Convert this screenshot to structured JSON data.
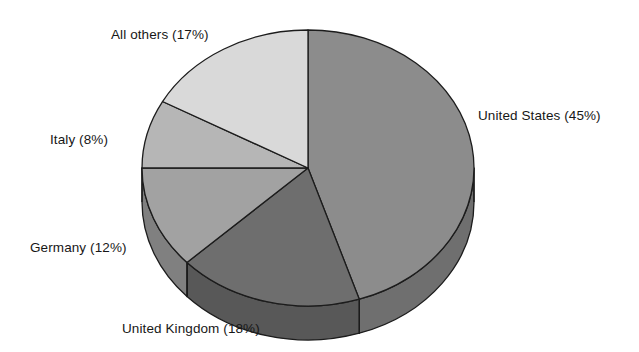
{
  "chart_data": {
    "type": "pie",
    "title": "",
    "subtitle": "",
    "xlabel": "",
    "ylabel": "",
    "legend_position": "none",
    "grid": false,
    "three_d": true,
    "units": "percent",
    "start_angle_deg": 0,
    "direction": "clockwise",
    "categories": [
      "United States",
      "United Kingdom",
      "Germany",
      "Italy",
      "All others"
    ],
    "values": [
      45,
      18,
      12,
      8,
      17
    ],
    "labels": [
      "United States (45%)",
      "United Kingdom (18%)",
      "Germany (12%)",
      "Italy (8%)",
      "All others (17%)"
    ],
    "slices": [
      {
        "name": "United States",
        "value": 45,
        "label": "United States (45%)",
        "color": "#8c8c8c",
        "side_color": "#6f6f6f"
      },
      {
        "name": "United Kingdom",
        "value": 18,
        "label": "United Kingdom (18%)",
        "color": "#6e6e6e",
        "side_color": "#585858"
      },
      {
        "name": "Germany",
        "value": 12,
        "label": "Germany (12%)",
        "color": "#a2a2a2",
        "side_color": "#808080"
      },
      {
        "name": "Italy",
        "value": 8,
        "label": "Italy (8%)",
        "color": "#b6b6b6",
        "side_color": "#949494"
      },
      {
        "name": "All others",
        "value": 17,
        "label": "All others (17%)",
        "color": "#d9d9d9",
        "side_color": "#b0b0b0"
      }
    ]
  },
  "colors": {
    "background": "#ffffff",
    "outline": "#1c1c1c",
    "text": "#171717"
  }
}
